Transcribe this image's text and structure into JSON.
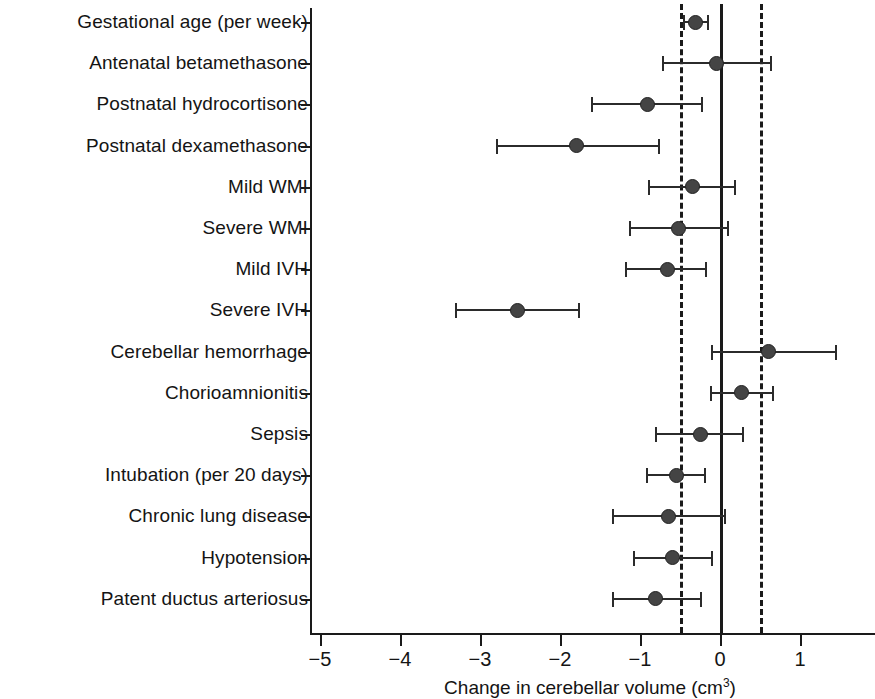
{
  "chart_data": {
    "type": "scatter",
    "subtype": "forest-plot",
    "title": "",
    "xlabel": "Change in cerebellar volume (cm",
    "xlabel_sup": "3",
    "xlabel_suffix": ")",
    "ylabel": "Clinical factor",
    "xlim": [
      -5.5,
      2.1
    ],
    "xticks": [
      -5,
      -4,
      -3,
      -2,
      -1,
      0,
      1,
      2
    ],
    "xtick_labels": [
      "−5",
      "−4",
      "−3",
      "−2",
      "−1",
      "0",
      "1",
      "2"
    ],
    "grid": false,
    "legend": false,
    "reference_lines": [
      {
        "value": 0,
        "style": "solid",
        "name": "null-effect-line"
      },
      {
        "value": -0.5,
        "style": "dashed",
        "name": "lower-threshold-line"
      },
      {
        "value": 0.5,
        "style": "dashed",
        "name": "upper-threshold-line"
      }
    ],
    "categories": [
      "Gestational age (per week)",
      "Antenatal betamethasone",
      "Postnatal hydrocortisone",
      "Postnatal dexamethasone",
      "Mild WMI",
      "Severe WMI",
      "Mild IVH",
      "Severe IVH",
      "Cerebellar hemorrhage",
      "Chorioamnionitis",
      "Sepsis",
      "Intubation (per 20 days)",
      "Chronic lung disease",
      "Hypotension",
      "Patent ductus arteriosus"
    ],
    "estimates": [
      -0.31,
      -0.04,
      -0.91,
      -1.79,
      -0.34,
      -0.52,
      -0.66,
      -2.53,
      0.6,
      0.27,
      -0.25,
      -0.55,
      -0.65,
      -0.59,
      -0.81
    ],
    "ci_low": [
      -0.46,
      -0.73,
      -1.61,
      -2.8,
      -0.9,
      -1.14,
      -1.19,
      -3.31,
      -0.11,
      -0.13,
      -0.81,
      -0.93,
      -1.35,
      -1.09,
      -1.35
    ],
    "ci_high": [
      -0.14,
      0.65,
      -0.21,
      -0.75,
      0.2,
      0.11,
      -0.16,
      -1.75,
      1.46,
      0.67,
      0.3,
      -0.18,
      0.08,
      -0.09,
      -0.23
    ],
    "colors": {
      "point": "#444444",
      "line": "#2b2b2b",
      "axis": "#1a1a1a",
      "background": "#ffffff"
    }
  }
}
